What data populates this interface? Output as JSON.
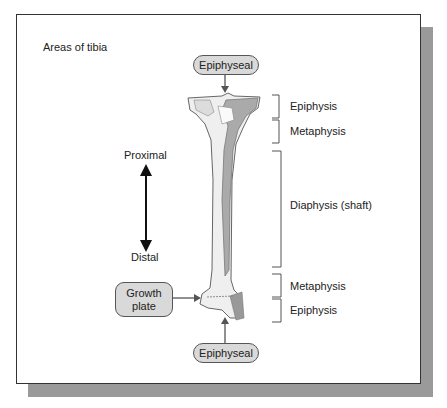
{
  "figure": {
    "title": "Areas of tibia",
    "top_callout": "Epiphyseal",
    "bottom_callout": "Epiphyseal",
    "growth_plate": "Growth plate",
    "direction": {
      "top": "Proximal",
      "bottom": "Distal"
    },
    "regions": [
      {
        "label": "Epiphysis",
        "position": "proximal"
      },
      {
        "label": "Metaphysis",
        "position": "proximal"
      },
      {
        "label": "Diaphysis (shaft)",
        "position": "middle"
      },
      {
        "label": "Metaphysis",
        "position": "distal"
      },
      {
        "label": "Epiphysis",
        "position": "distal"
      }
    ]
  }
}
